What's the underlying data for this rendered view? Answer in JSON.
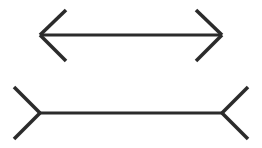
{
  "page": {
    "background_color": "#ffffff",
    "width": 262,
    "height": 148
  },
  "style": {
    "line_color": "#2b2b2b",
    "shaft_stroke_width": 3.2,
    "fin_stroke_width": 3.6
  },
  "figures": [
    {
      "id": "arrows-in",
      "name": "top-figure-inward-arrowheads",
      "description": "Horizontal line segment with arrowheads pointing outward at both ends (fins angle inward toward the center), making the shaft appear shorter.",
      "shaft": {
        "x1": 40,
        "y1": 35,
        "x2": 222,
        "y2": 35,
        "length": 182
      },
      "fins": [
        {
          "name": "left-upper-fin",
          "x1": 40,
          "y1": 35,
          "x2": 66,
          "y2": 10
        },
        {
          "name": "left-lower-fin",
          "x1": 40,
          "y1": 35,
          "x2": 66,
          "y2": 61
        },
        {
          "name": "right-upper-fin",
          "x1": 222,
          "y1": 35,
          "x2": 196,
          "y2": 10
        },
        {
          "name": "right-lower-fin",
          "x1": 222,
          "y1": 35,
          "x2": 196,
          "y2": 61
        }
      ]
    },
    {
      "id": "arrows-out",
      "name": "bottom-figure-outward-arrowheads",
      "description": "Horizontal line segment of identical length with fins angling outward (tails) at both ends, making the shaft appear longer.",
      "shaft": {
        "x1": 40,
        "y1": 113,
        "x2": 222,
        "y2": 113,
        "length": 182
      },
      "fins": [
        {
          "name": "left-upper-fin",
          "x1": 40,
          "y1": 113,
          "x2": 14,
          "y2": 87
        },
        {
          "name": "left-lower-fin",
          "x1": 40,
          "y1": 113,
          "x2": 14,
          "y2": 139
        },
        {
          "name": "right-upper-fin",
          "x1": 222,
          "y1": 113,
          "x2": 248,
          "y2": 87
        },
        {
          "name": "right-lower-fin",
          "x1": 222,
          "y1": 113,
          "x2": 248,
          "y2": 139
        }
      ]
    }
  ]
}
